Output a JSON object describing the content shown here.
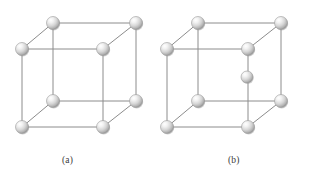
{
  "figure": {
    "background_color": "#ffffff",
    "top_rule": {
      "name": "top-divider-rule",
      "x1": 0,
      "y1": 3.5,
      "x2": 327,
      "y2": 3.5,
      "color": "#9a9a9a",
      "thickness": 1.2
    },
    "edge_color": "#8c8c8c",
    "edge_width": 1.0,
    "sphere": {
      "radius": 6.5,
      "center_radius": 6.0,
      "highlight_color": "#ffffff",
      "mid_color": "#d8d8d8",
      "edge_color": "#9b9b9b",
      "shadow_color": "#8a8a8a"
    },
    "panels": [
      {
        "id": "panel-a",
        "caption": "(a)",
        "caption_x": 62,
        "caption_y": 155,
        "lattice_type": "simple-cubic",
        "atom_count": 8,
        "vertices": {
          "back_top_left": [
            53,
            23
          ],
          "back_top_right": [
            136,
            23
          ],
          "back_bottom_left": [
            53,
            101
          ],
          "back_bottom_right": [
            136,
            101
          ],
          "front_top_left": [
            22,
            49
          ],
          "front_top_right": [
            103,
            49
          ],
          "front_bottom_left": [
            22,
            127
          ],
          "front_bottom_right": [
            103,
            127
          ]
        },
        "center_atom": null
      },
      {
        "id": "panel-b",
        "caption": "(b)",
        "caption_x": 228,
        "caption_y": 155,
        "lattice_type": "body-centered-cubic",
        "atom_count": 9,
        "vertices": {
          "back_top_left": [
            198,
            23
          ],
          "back_top_right": [
            281,
            23
          ],
          "back_bottom_left": [
            198,
            101
          ],
          "back_bottom_right": [
            281,
            101
          ],
          "front_top_left": [
            167,
            49
          ],
          "front_top_right": [
            248,
            49
          ],
          "front_bottom_left": [
            167,
            127
          ],
          "front_bottom_right": [
            248,
            127
          ]
        },
        "center_atom": [
          247,
          77
        ]
      }
    ]
  },
  "captions": {
    "a": "(a)",
    "b": "(b)"
  }
}
